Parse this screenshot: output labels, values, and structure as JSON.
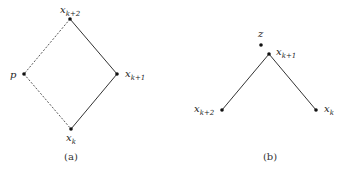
{
  "panel_a": {
    "caption": "(a)",
    "nodes": {
      "top": {
        "var": "x",
        "sub": "k+2",
        "x": 70,
        "y": 19
      },
      "left": {
        "var": "p",
        "sub": "",
        "x": 24,
        "y": 74
      },
      "right": {
        "var": "x",
        "sub": "k+1",
        "x": 117,
        "y": 74
      },
      "bottom": {
        "var": "x",
        "sub": "k",
        "x": 71,
        "y": 129
      }
    },
    "edges": [
      {
        "from": "top",
        "to": "right",
        "style": "solid"
      },
      {
        "from": "right",
        "to": "bottom",
        "style": "solid"
      },
      {
        "from": "top",
        "to": "left",
        "style": "dashed"
      },
      {
        "from": "left",
        "to": "bottom",
        "style": "dashed"
      }
    ]
  },
  "panel_b": {
    "caption": "(b)",
    "nodes": {
      "z": {
        "var": "z",
        "sub": "",
        "x": 261,
        "y": 45
      },
      "apex": {
        "var": "x",
        "sub": "k+1",
        "x": 269,
        "y": 54
      },
      "left": {
        "var": "x",
        "sub": "k+2",
        "x": 222,
        "y": 110
      },
      "right": {
        "var": "x",
        "sub": "k",
        "x": 316,
        "y": 110
      }
    },
    "edges": [
      {
        "from": "apex",
        "to": "left",
        "style": "solid"
      },
      {
        "from": "apex",
        "to": "right",
        "style": "solid"
      }
    ]
  }
}
